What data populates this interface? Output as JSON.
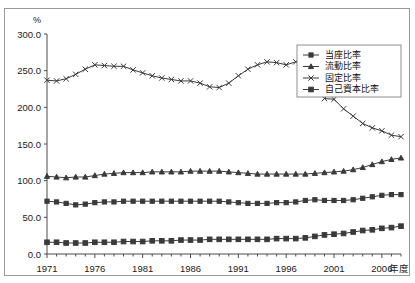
{
  "figure": {
    "top_cut_text": "────  ─  ──  ─────  ────────  ──  ────  ─────  ──",
    "unit_label": "%",
    "xaxis_title": "年度"
  },
  "legend": {
    "position": "top-right",
    "items": [
      {
        "label": "当座比率",
        "marker": "square",
        "key": "toza"
      },
      {
        "label": "流動比率",
        "marker": "triangle",
        "key": "ryudo"
      },
      {
        "label": "固定比率",
        "marker": "x-cross",
        "key": "kotei"
      },
      {
        "label": "自己資本比率",
        "marker": "filled-square",
        "key": "jikoshihon"
      }
    ]
  },
  "chart_data": {
    "type": "line",
    "title": "",
    "subtitle": "",
    "xlabel": "年度",
    "ylabel": "%",
    "unit": "%",
    "xlim": [
      1971,
      2008
    ],
    "ylim": [
      0.0,
      300.0
    ],
    "ytick_step": 50.0,
    "ytick_labels": [
      "0.0",
      "50.0",
      "100.0",
      "150.0",
      "200.0",
      "250.0",
      "300.0"
    ],
    "xtick_labels": [
      "1971",
      "1976",
      "1981",
      "1986",
      "1991",
      "1996",
      "2001",
      "2006"
    ],
    "xtick_label_step": 5,
    "minor_xticks_every": 1,
    "grid": false,
    "legend_position": "top-right",
    "x": [
      1971,
      1972,
      1973,
      1974,
      1975,
      1976,
      1977,
      1978,
      1979,
      1980,
      1981,
      1982,
      1983,
      1984,
      1985,
      1986,
      1987,
      1988,
      1989,
      1990,
      1991,
      1992,
      1993,
      1994,
      1995,
      1996,
      1997,
      1998,
      1999,
      2000,
      2001,
      2002,
      2003,
      2004,
      2005,
      2006,
      2007,
      2008
    ],
    "series": [
      {
        "name": "固定比率",
        "marker": "x-cross",
        "values": [
          237,
          236,
          239,
          245,
          252,
          258,
          257,
          256,
          256,
          251,
          247,
          243,
          240,
          238,
          236,
          236,
          233,
          228,
          227,
          233,
          243,
          252,
          258,
          262,
          261,
          258,
          262,
          274,
          242,
          212,
          211,
          198,
          188,
          178,
          172,
          168,
          162,
          160
        ]
      },
      {
        "name": "流動比率",
        "marker": "triangle",
        "values": [
          106,
          105,
          104,
          105,
          105,
          107,
          109,
          110,
          111,
          111,
          111,
          112,
          112,
          112,
          112,
          113,
          113,
          113,
          113,
          112,
          111,
          110,
          109,
          109,
          109,
          109,
          109,
          109,
          110,
          111,
          112,
          113,
          115,
          118,
          122,
          126,
          129,
          131
        ]
      },
      {
        "name": "当座比率",
        "marker": "square",
        "values": [
          72,
          71,
          69,
          67,
          68,
          70,
          71,
          71,
          72,
          72,
          72,
          72,
          72,
          72,
          72,
          72,
          72,
          72,
          72,
          71,
          70,
          69,
          69,
          69,
          70,
          70,
          71,
          73,
          74,
          73,
          73,
          73,
          74,
          76,
          78,
          80,
          81,
          81
        ]
      },
      {
        "name": "自己資本比率",
        "marker": "filled-square",
        "values": [
          16,
          16,
          15,
          15,
          15,
          16,
          16,
          16,
          17,
          17,
          17,
          18,
          18,
          18,
          19,
          19,
          19,
          20,
          20,
          20,
          20,
          20,
          20,
          20,
          21,
          21,
          21,
          22,
          24,
          26,
          27,
          28,
          30,
          32,
          33,
          35,
          36,
          38
        ]
      }
    ]
  }
}
